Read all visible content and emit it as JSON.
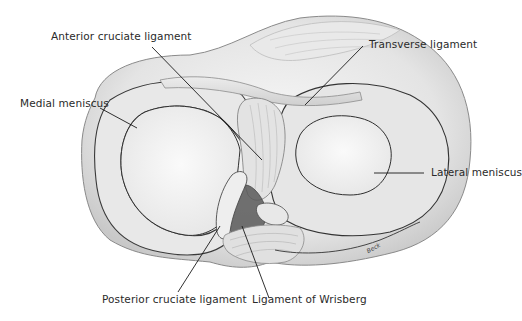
{
  "diagram": {
    "labels": [
      {
        "id": "acl",
        "text": "Anterior cruciate ligament"
      },
      {
        "id": "transverse",
        "text": "Transverse ligament"
      },
      {
        "id": "medial",
        "text": "Medial meniscus"
      },
      {
        "id": "lateral",
        "text": "Lateral meniscus"
      },
      {
        "id": "pcl",
        "text": "Posterior cruciate ligament"
      },
      {
        "id": "wrisberg",
        "text": "Ligament of Wrisberg"
      }
    ],
    "signature": "Beck",
    "colors": {
      "background": "#ffffff",
      "tissue_light": "#f1f1f1",
      "tissue_mid": "#d9d9d9",
      "tissue_shadow": "#9a9a9a",
      "outline": "#3a3a3a",
      "leader_line": "#1a1a1a"
    }
  }
}
